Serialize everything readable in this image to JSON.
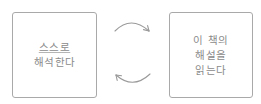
{
  "diagram": {
    "type": "cycle",
    "nodes": [
      {
        "id": "left",
        "lines": [
          "스스로",
          "해석한다"
        ],
        "underlined_line": 0
      },
      {
        "id": "right",
        "lines": [
          "이 책의",
          "해설을",
          "읽는다"
        ]
      }
    ],
    "edges": [
      {
        "from": "left",
        "to": "right",
        "shape": "arc-over",
        "icon": "curved-arrow-right"
      },
      {
        "from": "right",
        "to": "left",
        "shape": "arc-under",
        "icon": "curved-arrow-left"
      }
    ],
    "colors": {
      "border": "#a9a9a9",
      "text": "#8a8a8a",
      "arrow": "#9a9a9a",
      "background": "#ffffff"
    }
  }
}
